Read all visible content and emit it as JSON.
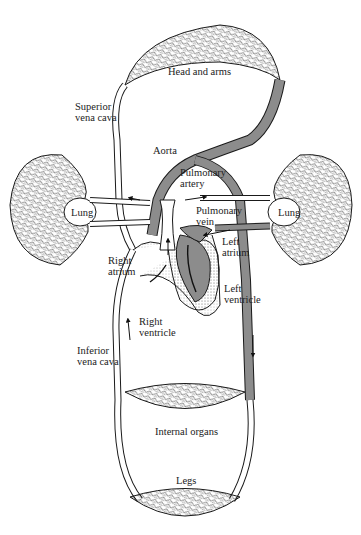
{
  "diagram": {
    "colors": {
      "oxygenated_fill": "#8c8c8c",
      "deoxygenated_fill": "#ffffff",
      "stroke": "#1a1a1a"
    },
    "labels": {
      "head_and_arms": "Head and arms",
      "superior_vena_cava_1": "Superior",
      "superior_vena_cava_2": "vena cava",
      "aorta": "Aorta",
      "pulmonary_artery_1": "Pulmonary",
      "pulmonary_artery_2": "artery",
      "pulmonary_vein_1": "Pulmonary",
      "pulmonary_vein_2": "vein",
      "lung_left": "Lung",
      "lung_right": "Lung",
      "right_atrium_1": "Right",
      "right_atrium_2": "atrium",
      "left_atrium_1": "Left",
      "left_atrium_2": "atrium",
      "left_ventricle_1": "Left",
      "left_ventricle_2": "ventricle",
      "right_ventricle_1": "Right",
      "right_ventricle_2": "ventricle",
      "inferior_vena_cava_1": "Inferior",
      "inferior_vena_cava_2": "vena cava",
      "internal_organs": "Internal organs",
      "legs": "Legs"
    }
  }
}
